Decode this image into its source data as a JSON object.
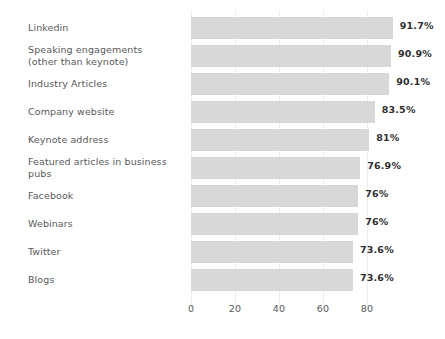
{
  "chart_data": {
    "type": "bar",
    "orientation": "horizontal",
    "title": "",
    "subtitle": "",
    "xlabel": "",
    "ylabel": "",
    "grid": true,
    "legend": null,
    "xlim": [
      0,
      91.7
    ],
    "axis_ticks": [
      "0",
      "20",
      "40",
      "60",
      "80"
    ],
    "axis_tick_values": [
      0,
      20,
      40,
      60,
      80
    ],
    "categories": [
      "Linkedin",
      "Speaking engagements\n(other than keynote)",
      "Industry Articles",
      "Company website",
      "Keynote address",
      "Featured articles in business pubs",
      "Facebook",
      "Webinars",
      "Twitter",
      "Blogs"
    ],
    "values": [
      91.7,
      90.9,
      90.1,
      83.5,
      81,
      76.9,
      76,
      76,
      73.6,
      73.6
    ],
    "value_labels": [
      "91.7%",
      "90.9%",
      "90.1%",
      "83.5%",
      "81%",
      "76.9%",
      "76%",
      "76%",
      "73.6%",
      "73.6%"
    ],
    "colors": {
      "bar": "#d8d8d8",
      "background": "#ffffff",
      "label_text": "#59595b",
      "value_text": "#2f2f30",
      "gridline": "#eeeeee"
    }
  }
}
